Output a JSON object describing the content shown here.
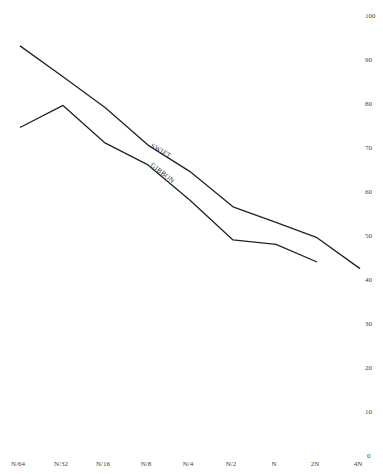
{
  "chart_data": {
    "type": "line",
    "title": "",
    "xlabel": "",
    "ylabel": "",
    "categories": [
      "N/64",
      "N/32",
      "N/16",
      "N/8",
      "N/4",
      "N/2",
      "N",
      "2N",
      "4N"
    ],
    "y_ticks": [
      0,
      10,
      20,
      30,
      40,
      50,
      60,
      70,
      80,
      90,
      100
    ],
    "ylim": [
      0,
      100
    ],
    "y_axis_position": "right",
    "grid": false,
    "legend": "inline labels",
    "series": [
      {
        "name": "SWIFT",
        "values": [
          93,
          86,
          79,
          70.5,
          64.5,
          56.5,
          53,
          49.5,
          42.5
        ]
      },
      {
        "name": "GIBBON",
        "values": [
          74.5,
          79.5,
          71,
          66,
          58,
          49,
          48,
          44,
          null
        ]
      }
    ]
  }
}
